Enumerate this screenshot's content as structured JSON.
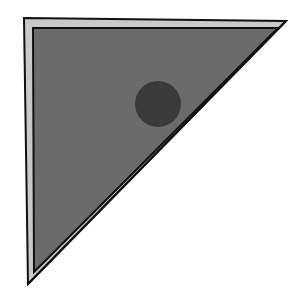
{
  "diagram": {
    "colors": {
      "background": "#ffffff",
      "fill": "#6b6b6b",
      "bevel": "#c9c9c9",
      "outline": "#111111",
      "dot": "#3a3a3a"
    },
    "triangle": {
      "outer": [
        [
          24,
          18
        ],
        [
          286,
          21
        ],
        [
          28,
          284
        ]
      ],
      "inner": [
        [
          33,
          28
        ],
        [
          278,
          28
        ],
        [
          34,
          270
        ]
      ]
    },
    "dot": {
      "cx": 158,
      "cy": 104,
      "r": 23
    }
  }
}
